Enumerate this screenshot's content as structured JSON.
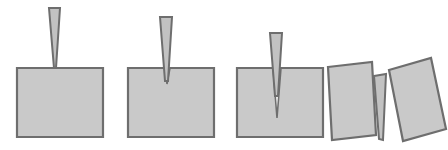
{
  "figure": {
    "title": "Wedge splitting of a block: four-stage sequence",
    "background_color": "#ffffff",
    "fill_color": "#c9c9c9",
    "stroke_color": "#6e6e6e",
    "wedge_fill_color": "#c2c2c2",
    "crack_fill_color": "#ffffff",
    "panel_count": "4"
  },
  "chart_data": {
    "type": "diagram",
    "title": "Wedge splitting of a block: four-stage sequence",
    "xlabel": "",
    "ylabel": "",
    "panels": [
      {
        "index": "1",
        "name": "contact",
        "description": "Wedge touches top surface of intact block; no penetration.",
        "block": {
          "shape": "rectangle",
          "points": "17,68 103,68 103,137 17,137"
        },
        "wedge": {
          "shape": "tapered-wedge",
          "points": "49,8 60,8 56,68 54,68"
        },
        "crack": {
          "shape": "none",
          "points": "",
          "depth": "0"
        }
      },
      {
        "index": "2",
        "name": "initial-penetration",
        "description": "Wedge tip penetrates the block, a short crack forms below the tip.",
        "block": {
          "shape": "rectangle",
          "points": "128,68 214,68 214,137 128,137"
        },
        "wedge": {
          "shape": "tapered-wedge",
          "points": "160,17 172,17 168,81 165,81"
        },
        "crack": {
          "shape": "slit",
          "points": "165,68 170,68 167,84",
          "depth": "16"
        }
      },
      {
        "index": "3",
        "name": "crack-propagation",
        "description": "Wedge driven deeper; crack propagates well into the block.",
        "block": {
          "shape": "rectangle",
          "points": "237,68 323,68 323,137 237,137"
        },
        "wedge": {
          "shape": "tapered-wedge",
          "points": "270,33 282,33 278,96 275,96"
        },
        "crack": {
          "shape": "slit",
          "points": "273,68 281,68 277,118",
          "depth": "50"
        }
      },
      {
        "index": "4",
        "name": "full-split",
        "description": "Block has split into two halves rotated apart, wedge between them.",
        "left_half": {
          "shape": "tilted-rectangle",
          "points": "328,67 372,62 376,135 332,140"
        },
        "right_half": {
          "shape": "tilted-rectangle",
          "points": "389,70 431,58 446,129 403,141"
        },
        "wedge": {
          "shape": "tapered-wedge",
          "points": "374,76 386,74 383,140 379,139"
        },
        "crack": {
          "shape": "open-gap",
          "points": "376,77 387,76 382,141",
          "depth": "65"
        }
      }
    ]
  }
}
